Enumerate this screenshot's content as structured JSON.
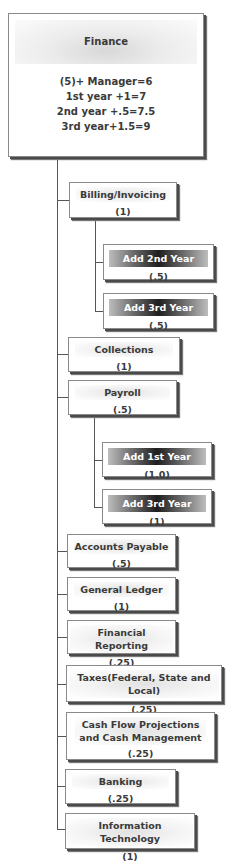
{
  "root": {
    "title": "Finance",
    "lines": [
      "(5)+ Manager=6",
      "1st year +1=7",
      "2nd year +.5=7.5",
      "3rd year+1.5=9"
    ]
  },
  "units": [
    {
      "title": "Billing/Invoicing",
      "value": "(1)",
      "children": [
        {
          "title": "Add 2nd Year",
          "value": "(.5)"
        },
        {
          "title": "Add 3rd Year",
          "value": "(.5)"
        }
      ]
    },
    {
      "title": "Collections",
      "value": "(1)"
    },
    {
      "title": "Payroll",
      "value": "(.5)",
      "children": [
        {
          "title": "Add 1st Year",
          "value": "(1.0)"
        },
        {
          "title": "Add 3rd Year",
          "value": "(1)"
        }
      ]
    },
    {
      "title": "Accounts Payable",
      "value": "(.5)"
    },
    {
      "title": "General Ledger",
      "value": "(1)"
    },
    {
      "title": "Financial Reporting",
      "value": "(.25)"
    },
    {
      "title": "Taxes(Federal, State and Local)",
      "value": "(.25)"
    },
    {
      "title": "Cash Flow Projections and Cash Management",
      "value": "(.25)"
    },
    {
      "title": "Banking",
      "value": "(.25)"
    },
    {
      "title": "Information Technology",
      "value": "(1)"
    }
  ]
}
